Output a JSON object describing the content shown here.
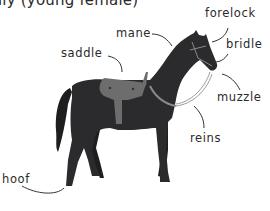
{
  "title": "lly (young female)",
  "labels": {
    "forelock": "forelock",
    "bridle": "bridle",
    "mane": "mane",
    "saddle": "saddle",
    "muzzle": "muzzle",
    "reins": "reins",
    "hoof": "hoof"
  },
  "colors": {
    "horse_body": "#2b2a2c",
    "saddle": "#6e6d6e",
    "tack": "#8a8a8a",
    "text": "#2a2a2a"
  }
}
